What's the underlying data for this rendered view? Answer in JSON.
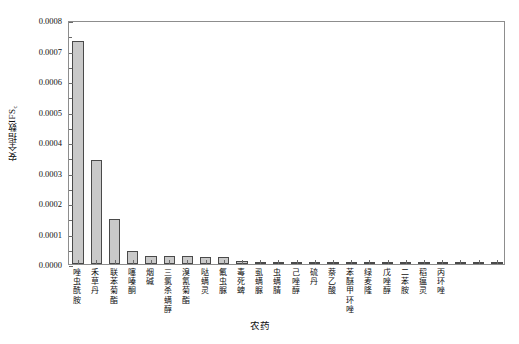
{
  "chart_data": {
    "type": "bar",
    "title": "",
    "xlabel": "农药",
    "ylabel": "安全指数IFS",
    "ylabel_sub": "c",
    "ylim": [
      0.0,
      0.0008
    ],
    "ytick_labels": [
      "0.0000",
      "0.0001",
      "0.0002",
      "0.0003",
      "0.0004",
      "0.0005",
      "0.0006",
      "0.0007",
      "0.0008"
    ],
    "ytick_values": [
      0.0,
      0.0001,
      0.0002,
      0.0003,
      0.0004,
      0.0005,
      0.0006,
      0.0007,
      0.0008
    ],
    "minor_tick_step": 5e-05,
    "grid": false,
    "legend": false,
    "bar_fill": "#c9c9c9",
    "bar_edge": "#4a4a4a",
    "axis_color": "#8d8d8d",
    "categories": [
      "唑虫酰胺",
      "禾草丹",
      "联苯菊酯",
      "噻嗪酮",
      "烟碱",
      "三氯杀螨醇",
      "溴氰菊酯",
      "哒螨灵",
      "氟虫脲",
      "毒死蜱",
      "虱螨脲",
      "虫螨腈",
      "己唑醇",
      "硫丹",
      "萘乙酸",
      "苯醚甲环唑",
      "绿麦隆",
      "戊唑醇",
      "二苯胺",
      "稻瘟灵",
      "丙环唑",
      "",
      "",
      ""
    ],
    "values": [
      0.00073,
      0.000342,
      0.000147,
      4.35e-05,
      2.65e-05,
      2.55e-05,
      2.5e-05,
      2.35e-05,
      2.3e-05,
      1.05e-05,
      7.5e-06,
      6e-06,
      4.5e-06,
      3.5e-06,
      2.8e-06,
      2.2e-06,
      1.8e-06,
      1.4e-06,
      1.1e-06,
      8e-07,
      6e-07,
      4e-07,
      3e-07,
      2e-07
    ]
  }
}
